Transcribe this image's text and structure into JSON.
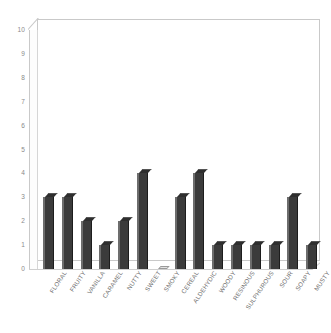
{
  "chart_data": {
    "type": "bar",
    "title": "",
    "subtitle": "",
    "xlabel": "",
    "ylabel": "",
    "ylim": [
      0,
      10
    ],
    "yticks": [
      0,
      1,
      2,
      3,
      4,
      5,
      6,
      7,
      8,
      9,
      10
    ],
    "grid": false,
    "legend": null,
    "style": "3d-column",
    "bar_color": "#3b3b3b",
    "bar_edge_color": "#6d6d6d",
    "axis_color": "#c9c9c9",
    "tick_label_color": "#8a8a8a",
    "background": "#ffffff",
    "categories": [
      "FLORAL",
      "FRUITY",
      "VANILLA",
      "CARAMEL",
      "NUTTY",
      "SWEET",
      "SMOKY",
      "CEREAL",
      "ALDEHYDIC",
      "WOODY",
      "RESINOUS",
      "SULPHUROUS",
      "SOUR",
      "SOAPY",
      "MUSTY"
    ],
    "values": [
      3,
      3,
      2,
      1,
      2,
      4,
      0,
      3,
      4,
      1,
      1,
      1,
      1,
      3,
      1
    ]
  }
}
